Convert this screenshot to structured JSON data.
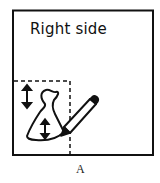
{
  "figure": {
    "box_label": "Right side",
    "caption": "A",
    "elements": {
      "outer_frame": "solid-rectangle",
      "fold_guide": "dashed-lines",
      "pattern_piece": "bell-shaped-piece",
      "grainline_arrows": [
        "double-arrow-outside",
        "double-arrow-inside"
      ],
      "tool": "pencil-icon"
    },
    "colors": {
      "ink": "#111111",
      "background": "#ffffff"
    }
  }
}
